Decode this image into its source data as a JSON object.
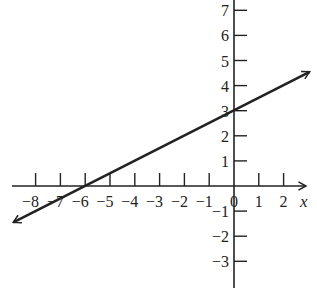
{
  "chart_data": {
    "type": "line",
    "title": "",
    "xlabel": "x",
    "ylabel": "",
    "xlim": [
      -8,
      2
    ],
    "ylim": [
      -3,
      7
    ],
    "x_ticks": [
      -8,
      -7,
      -6,
      -5,
      -4,
      -3,
      -2,
      -1,
      0,
      1,
      2
    ],
    "y_ticks": [
      -3,
      -2,
      -1,
      1,
      2,
      3,
      4,
      5,
      6,
      7
    ],
    "x_tick_labels": [
      "−8",
      "−7",
      "−6",
      "−5",
      "−4",
      "−3",
      "−2",
      "−1",
      "0",
      "1",
      "2"
    ],
    "y_tick_labels": [
      "−3",
      "−2",
      "−1",
      "1",
      "2",
      "3",
      "4",
      "5",
      "6",
      "7"
    ],
    "grid": false,
    "legend": null,
    "series": [
      {
        "name": "line",
        "equation": "y = 0.5x + 3",
        "slope": 0.5,
        "y_intercept": 3,
        "x_intercept": -6,
        "points": [
          [
            -8.9,
            -1.45
          ],
          [
            -6,
            0
          ],
          [
            0,
            3
          ],
          [
            3.05,
            4.55
          ]
        ],
        "arrows": "both",
        "color": "#222222"
      }
    ]
  },
  "colors": {
    "ink": "#222222",
    "background": "#ffffff"
  }
}
